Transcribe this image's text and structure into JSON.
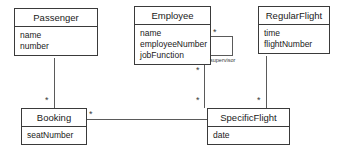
{
  "diagram": {
    "type": "uml-class-diagram",
    "classes": [
      {
        "id": "passenger",
        "name": "Passenger",
        "attributes": [
          "name",
          "number"
        ]
      },
      {
        "id": "employee",
        "name": "Employee",
        "attributes": [
          "name",
          "employeeNumber",
          "jobFunction"
        ]
      },
      {
        "id": "regularflight",
        "name": "RegularFlight",
        "attributes": [
          "time",
          "flightNumber"
        ]
      },
      {
        "id": "booking",
        "name": "Booking",
        "attributes": [
          "seatNumber"
        ]
      },
      {
        "id": "specificflight",
        "name": "SpecificFlight",
        "attributes": [
          "date"
        ]
      }
    ],
    "associations": [
      {
        "id": "passenger-booking",
        "from": "passenger",
        "to": "booking",
        "label": "",
        "from_multiplicity": "",
        "to_multiplicity": "*"
      },
      {
        "id": "booking-specificflight",
        "from": "booking",
        "to": "specificflight",
        "label": "",
        "from_multiplicity": "*",
        "to_multiplicity": ""
      },
      {
        "id": "employee-specificflight",
        "from": "employee",
        "to": "specificflight",
        "label": "",
        "from_multiplicity": "*",
        "to_multiplicity": "*"
      },
      {
        "id": "regularflight-specificflight",
        "from": "regularflight",
        "to": "specificflight",
        "label": "",
        "from_multiplicity": "",
        "to_multiplicity": "*"
      },
      {
        "id": "employee-supervisor",
        "from": "employee",
        "to": "employee",
        "label": "supervisor",
        "from_multiplicity": "*",
        "to_multiplicity": ""
      }
    ],
    "multiplicity_symbol": "*",
    "colors": {
      "background": "#ffffff",
      "box_border": "#3a3a3a",
      "line": "#5a5a5a",
      "text": "#1a1a1a"
    }
  }
}
